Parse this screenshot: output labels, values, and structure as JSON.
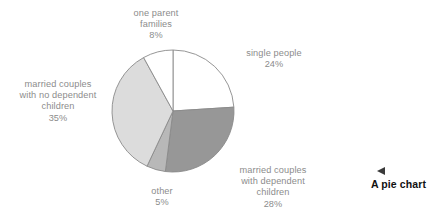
{
  "caption": {
    "marker_icon": "triangle-left-icon",
    "text": "A pie chart"
  },
  "chart_data": {
    "type": "pie",
    "title": "",
    "xlabel": "",
    "ylabel": "",
    "legend_position": "none",
    "grid": false,
    "start_angle_deg": 0,
    "direction": "clockwise",
    "center": {
      "x": 173,
      "y": 111
    },
    "radius": 61,
    "stroke_color": "#8a8a8a",
    "categories": [
      "single people",
      "married couples with dependent children",
      "other",
      "married couples with no dependent children",
      "one parent families"
    ],
    "values": [
      24,
      28,
      5,
      35,
      8
    ],
    "value_suffix": "%",
    "colors": [
      "#ffffff",
      "#979797",
      "#b8b8b8",
      "#dcdcdc",
      "#ffffff"
    ],
    "slices": [
      {
        "name": "single people",
        "value": 24,
        "color": "#ffffff",
        "label_lines": "single people\n24%"
      },
      {
        "name": "married couples with dependent children",
        "value": 28,
        "color": "#979797",
        "label_lines": "married couples\nwith dependent\nchildren\n28%"
      },
      {
        "name": "other",
        "value": 5,
        "color": "#b8b8b8",
        "label_lines": "other\n5%"
      },
      {
        "name": "married couples with no dependent children",
        "value": 35,
        "color": "#dcdcdc",
        "label_lines": "married couples\nwith no dependent\nchildren\n35%"
      },
      {
        "name": "one parent families",
        "value": 8,
        "color": "#ffffff",
        "label_lines": "one parent\nfamilies\n8%"
      }
    ]
  }
}
